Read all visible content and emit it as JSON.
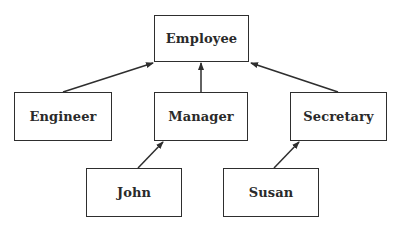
{
  "diagram": {
    "type": "class-hierarchy",
    "nodes": [
      {
        "id": "employee",
        "label": "Employee",
        "x": 154,
        "y": 15,
        "w": 95,
        "h": 47
      },
      {
        "id": "engineer",
        "label": "Engineer",
        "x": 14,
        "y": 92,
        "w": 98,
        "h": 49
      },
      {
        "id": "manager",
        "label": "Manager",
        "x": 154,
        "y": 92,
        "w": 94,
        "h": 49
      },
      {
        "id": "secretary",
        "label": "Secretary",
        "x": 290,
        "y": 92,
        "w": 97,
        "h": 49
      },
      {
        "id": "john",
        "label": "John",
        "x": 86,
        "y": 168,
        "w": 96,
        "h": 49
      },
      {
        "id": "susan",
        "label": "Susan",
        "x": 223,
        "y": 168,
        "w": 96,
        "h": 49
      }
    ],
    "edges": [
      {
        "from": "engineer",
        "to": "employee",
        "x1": 63,
        "y1": 92,
        "x2": 153,
        "y2": 63
      },
      {
        "from": "manager",
        "to": "employee",
        "x1": 201,
        "y1": 92,
        "x2": 201,
        "y2": 63
      },
      {
        "from": "secretary",
        "to": "employee",
        "x1": 338,
        "y1": 92,
        "x2": 251,
        "y2": 63
      },
      {
        "from": "john",
        "to": "manager",
        "x1": 138,
        "y1": 168,
        "x2": 163,
        "y2": 142
      },
      {
        "from": "susan",
        "to": "secretary",
        "x1": 274,
        "y1": 168,
        "x2": 299,
        "y2": 142
      }
    ],
    "colors": {
      "stroke": "#2e2e2e",
      "text": "#2a2a2a",
      "background": "#ffffff"
    }
  }
}
